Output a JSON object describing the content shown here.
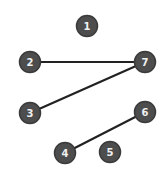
{
  "diagram": {
    "type": "graph",
    "colors": {
      "background": "#ffffff",
      "node_fill": "#4d4d4d",
      "node_stroke": "#3a3a3a",
      "node_text": "#f0f0f0",
      "edge": "#222222"
    },
    "nodes": [
      {
        "id": "1",
        "label": "1",
        "x": 87,
        "y": 26
      },
      {
        "id": "2",
        "label": "2",
        "x": 30,
        "y": 62
      },
      {
        "id": "3",
        "label": "3",
        "x": 30,
        "y": 113
      },
      {
        "id": "4",
        "label": "4",
        "x": 65,
        "y": 153
      },
      {
        "id": "5",
        "label": "5",
        "x": 110,
        "y": 152
      },
      {
        "id": "6",
        "label": "6",
        "x": 145,
        "y": 112
      },
      {
        "id": "7",
        "label": "7",
        "x": 145,
        "y": 62
      }
    ],
    "edges": [
      {
        "from": "2",
        "to": "7"
      },
      {
        "from": "3",
        "to": "7"
      },
      {
        "from": "4",
        "to": "6"
      }
    ]
  }
}
